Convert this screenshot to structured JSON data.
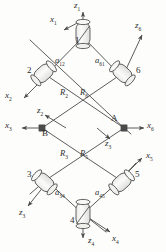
{
  "diagram": {
    "type": "kinematic-linkage-schematic",
    "stroke_color": "#4a4a4a",
    "fill_color": "#f2f2f0",
    "background": "#fdfdfc",
    "joints": [
      {
        "id": "1",
        "label": "1",
        "shape": "cylinder",
        "orientation": "vertical",
        "x": 83,
        "y": 33
      },
      {
        "id": "2",
        "label": "2",
        "shape": "cylinder",
        "orientation": "diagonal-down-right",
        "x": 44,
        "y": 73
      },
      {
        "id": "3",
        "label": "3",
        "shape": "cylinder",
        "orientation": "diagonal-up-right",
        "x": 44,
        "y": 182
      },
      {
        "id": "4",
        "label": "4",
        "shape": "cylinder",
        "orientation": "vertical",
        "x": 83,
        "y": 218
      },
      {
        "id": "5",
        "label": "5",
        "shape": "cylinder",
        "orientation": "diagonal-down-right",
        "x": 122,
        "y": 182
      },
      {
        "id": "6",
        "label": "6",
        "shape": "cylinder",
        "orientation": "diagonal-up-right",
        "x": 122,
        "y": 73
      }
    ],
    "link_labels": [
      {
        "name": "a12",
        "base": "a",
        "sub": "12",
        "x": 57,
        "y": 60
      },
      {
        "name": "a61",
        "base": "a",
        "sub": "61",
        "x": 96,
        "y": 60
      },
      {
        "name": "a34",
        "base": "a",
        "sub": "34",
        "x": 57,
        "y": 192
      },
      {
        "name": "a45",
        "base": "a",
        "sub": "45",
        "x": 96,
        "y": 192
      }
    ],
    "offset_labels": [
      {
        "name": "R2",
        "base": "R",
        "sub": "2",
        "x": 62,
        "y": 93
      },
      {
        "name": "R6",
        "base": "R",
        "sub": "6",
        "x": 82,
        "y": 93
      },
      {
        "name": "R3",
        "base": "R",
        "sub": "3",
        "x": 62,
        "y": 154
      },
      {
        "name": "R5",
        "base": "R",
        "sub": "5",
        "x": 82,
        "y": 154
      }
    ],
    "point_labels": [
      {
        "name": "A",
        "label": "A",
        "x": 113,
        "y": 119
      },
      {
        "name": "B",
        "label": "B",
        "x": 44,
        "y": 133
      }
    ],
    "axis_labels": [
      {
        "name": "z1",
        "base": "z",
        "sub": "1",
        "x": 77,
        "y": 3
      },
      {
        "name": "x1",
        "base": "x",
        "sub": "1",
        "x": 54,
        "y": 18
      },
      {
        "name": "z6",
        "base": "z",
        "sub": "6",
        "x": 137,
        "y": 23
      },
      {
        "name": "x2",
        "base": "x",
        "sub": "2",
        "x": 8,
        "y": 94
      },
      {
        "name": "z2",
        "base": "z",
        "sub": "2",
        "x": 39,
        "y": 111
      },
      {
        "name": "x3",
        "base": "x",
        "sub": "3",
        "x": 8,
        "y": 123
      },
      {
        "name": "x6",
        "base": "x",
        "sub": "6",
        "x": 146,
        "y": 123
      },
      {
        "name": "z3",
        "base": "z",
        "sub": "3",
        "x": 104,
        "y": 139
      },
      {
        "name": "x5",
        "base": "x",
        "sub": "5",
        "x": 146,
        "y": 155
      },
      {
        "name": "z3-lower",
        "base": "z",
        "sub": "3",
        "x": 20,
        "y": 211
      },
      {
        "name": "z4",
        "base": "z",
        "sub": "4",
        "x": 79,
        "y": 239
      },
      {
        "name": "x4",
        "base": "x",
        "sub": "4",
        "x": 113,
        "y": 237
      }
    ]
  }
}
